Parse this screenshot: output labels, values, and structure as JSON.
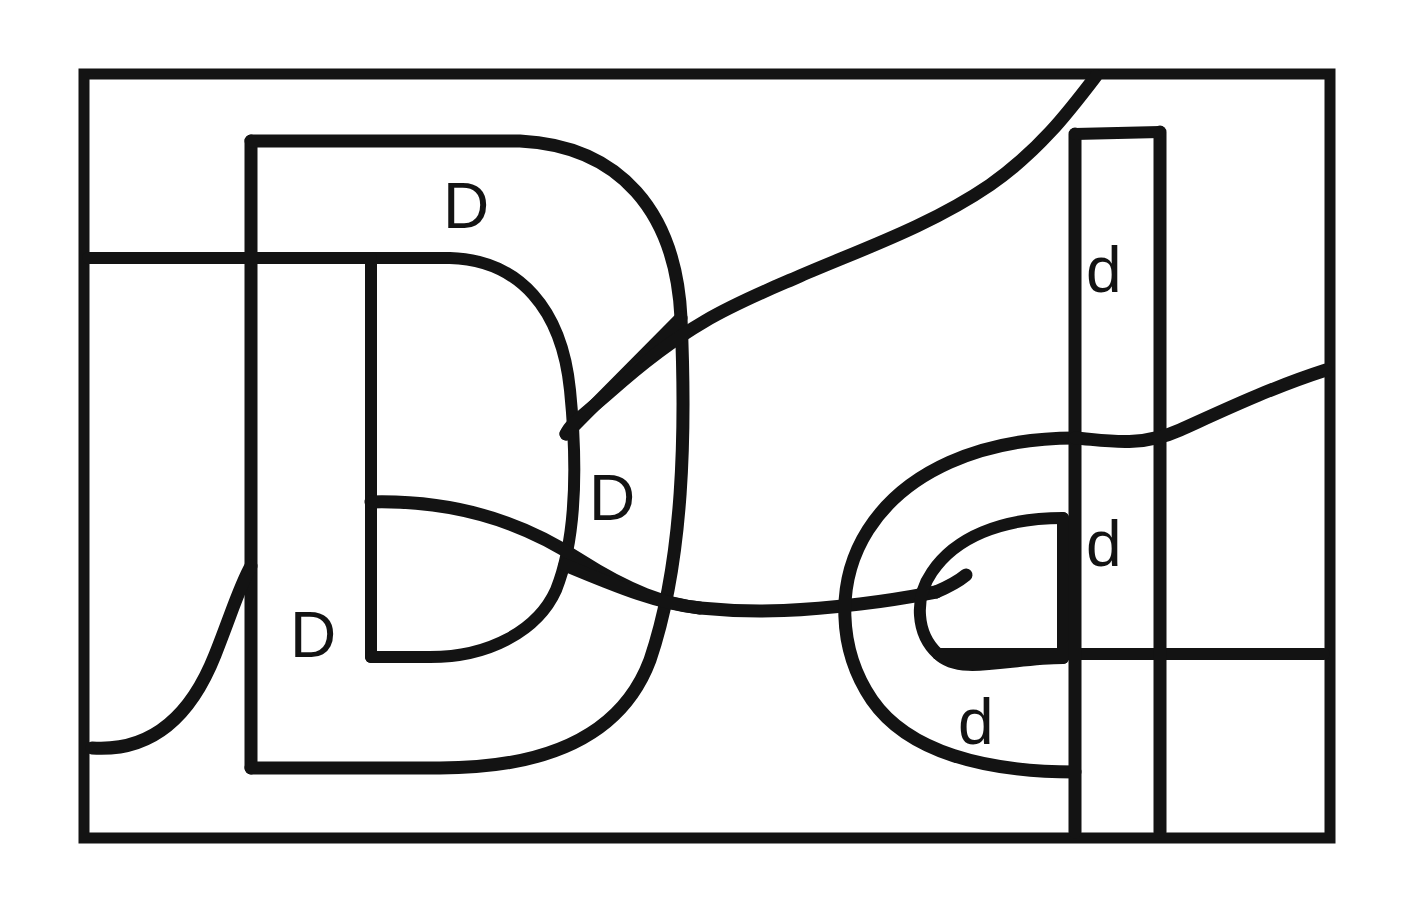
{
  "figure": {
    "background_color": "#ffffff",
    "ink_color": "#131313",
    "canvas": {
      "width": 1414,
      "height": 898
    },
    "frame": {
      "name": "outer-rectangle",
      "x": 78,
      "y": 68,
      "width": 1257,
      "height": 775,
      "stroke_width": 11
    },
    "labels": [
      {
        "id": "label-D-1",
        "text": "D",
        "case": "uppercase",
        "x": 443,
        "y": 174,
        "font_size": 64
      },
      {
        "id": "label-D-2",
        "text": "D",
        "case": "uppercase",
        "x": 589,
        "y": 466,
        "font_size": 64
      },
      {
        "id": "label-D-3",
        "text": "D",
        "case": "uppercase",
        "x": 290,
        "y": 603,
        "font_size": 64
      },
      {
        "id": "label-d-1",
        "text": "d",
        "case": "lowercase",
        "x": 1086,
        "y": 238,
        "font_size": 64
      },
      {
        "id": "label-d-2",
        "text": "d",
        "case": "lowercase",
        "x": 1086,
        "y": 512,
        "font_size": 64
      },
      {
        "id": "label-d-3",
        "text": "d",
        "case": "lowercase",
        "x": 958,
        "y": 690,
        "font_size": 64
      }
    ],
    "label_counts": {
      "uppercase_D": 3,
      "lowercase_d": 3,
      "total": 6
    },
    "strokes": [
      {
        "id": "outer-D-outline",
        "description": "Large uppercase D occupying the left half, open at bottom-left"
      },
      {
        "id": "inner-D-outline",
        "description": "Smaller nested D inside the large D"
      },
      {
        "id": "left-horizontal-line",
        "description": "Horizontal line from left border into the D at y=258"
      },
      {
        "id": "left-tail-curve",
        "description": "Curve entering from left border near y=748 rising to the D spine"
      },
      {
        "id": "sigmoid-top-curve",
        "description": "S-curve descending from the top border toward the center crossing"
      },
      {
        "id": "center-diagonal",
        "description": "Diagonal from the D bowl down-right to the center junction"
      },
      {
        "id": "mid-horizontal-curve",
        "description": "Long wavy horizontal through the middle of the figure"
      },
      {
        "id": "right-d-outer",
        "description": "Large lowercase d bowl on the right half"
      },
      {
        "id": "right-d-inner",
        "description": "Smaller nested d bowl inside the right d"
      },
      {
        "id": "right-vertical-outer",
        "description": "Vertical line at x=1160 from y=130 to the bottom border"
      },
      {
        "id": "right-vertical-inner",
        "description": "Vertical line at x=1075 from y=132 to the bottom border"
      },
      {
        "id": "right-border-curve",
        "description": "Curve meeting the right border near y=370"
      },
      {
        "id": "lower-right-horizontal",
        "description": "Horizontal at y=655 from the inner d to the right border"
      }
    ]
  }
}
